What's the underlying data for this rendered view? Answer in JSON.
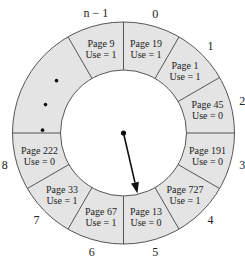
{
  "slots": [
    {
      "index": "0",
      "page": "Page 19",
      "use": "Use = 1"
    },
    {
      "index": "1",
      "page": "Page 1",
      "use": "Use = 1"
    },
    {
      "index": "2",
      "page": "Page 45",
      "use": "Use = 0"
    },
    {
      "index": "3",
      "page": "Page 191",
      "use": "Use = 0"
    },
    {
      "index": "4",
      "page": "Page 727",
      "use": "Use = 1"
    },
    {
      "index": "5",
      "page": "Page 13",
      "use": "Use = 0"
    },
    {
      "index": "6",
      "page": "Page 67",
      "use": "Use = 1"
    },
    {
      "index": "7",
      "page": "Page 33",
      "use": "Use = 1"
    },
    {
      "index": "8",
      "page": "Page 222",
      "use": "Use = 0"
    },
    {
      "index": "n − 1",
      "page": "Page 9",
      "use": "Use = 1"
    }
  ],
  "ellipsis": "•••",
  "pointer_target_index": "5",
  "colors": {
    "segment_fill": "#e4e4e4",
    "stroke": "#555555",
    "text": "#222222"
  }
}
